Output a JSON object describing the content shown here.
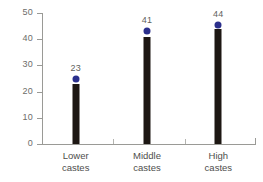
{
  "chart_data": {
    "type": "bar",
    "title": "",
    "subtitle": "",
    "xlabel": "",
    "ylabel": "",
    "categories": [
      "Lower\ncastes",
      "Middle\ncastes",
      "High\ncastes"
    ],
    "category_lines": [
      [
        "Lower",
        "castes"
      ],
      [
        "Middle",
        "castes"
      ],
      [
        "High",
        "castes"
      ]
    ],
    "values": [
      23,
      41,
      44
    ],
    "data_labels": [
      "23",
      "41",
      "44"
    ],
    "marker_values": [
      25,
      43,
      45.5
    ],
    "ylim": [
      0,
      50
    ],
    "yticks": [
      0,
      10,
      20,
      30,
      40,
      50
    ],
    "ytick_labels": [
      "0",
      "10",
      "20",
      "30",
      "40",
      "50"
    ],
    "grid": false,
    "legend": null,
    "series": [
      {
        "name": "value",
        "values": [
          23,
          41,
          44
        ]
      }
    ],
    "colors": {
      "bar": "#1d1713",
      "marker": "#2b2f8c",
      "axis": "#9a9a96",
      "tick_text": "#6d6d6a",
      "label_text": "#5f5f5d",
      "category_text": "#4e4e4c",
      "background": "#ffffff"
    }
  }
}
